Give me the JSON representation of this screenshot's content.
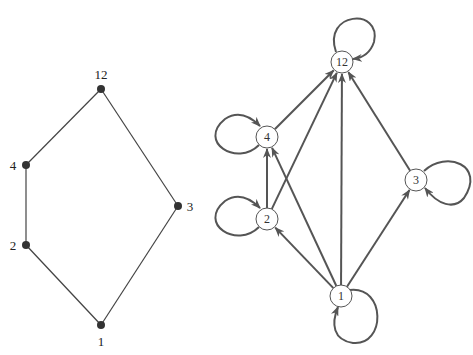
{
  "hasse": {
    "nodes": [
      {
        "id": "1",
        "label": "1",
        "x": 101,
        "y": 325,
        "lx": 101,
        "ly": 346
      },
      {
        "id": "2",
        "label": "2",
        "x": 26,
        "y": 245,
        "lx": 13,
        "ly": 250
      },
      {
        "id": "4",
        "label": "4",
        "x": 26,
        "y": 165,
        "lx": 13,
        "ly": 170
      },
      {
        "id": "3",
        "label": "3",
        "x": 178,
        "y": 206,
        "lx": 190,
        "ly": 211
      },
      {
        "id": "12",
        "label": "12",
        "x": 101,
        "y": 89,
        "lx": 101,
        "ly": 79
      }
    ],
    "edges": [
      [
        "1",
        "2"
      ],
      [
        "2",
        "4"
      ],
      [
        "4",
        "12"
      ],
      [
        "1",
        "3"
      ],
      [
        "3",
        "12"
      ]
    ]
  },
  "digraph": {
    "nodes": [
      {
        "id": "1",
        "label": "1",
        "x": 341,
        "y": 296,
        "loop": "bottom-right"
      },
      {
        "id": "2",
        "label": "2",
        "x": 267,
        "y": 219,
        "loop": "left"
      },
      {
        "id": "4",
        "label": "4",
        "x": 267,
        "y": 137,
        "loop": "left"
      },
      {
        "id": "3",
        "label": "3",
        "x": 416,
        "y": 180,
        "loop": "right"
      },
      {
        "id": "12",
        "label": "12",
        "x": 342,
        "y": 62,
        "loop": "top"
      }
    ],
    "edges": [
      [
        "1",
        "2"
      ],
      [
        "1",
        "3"
      ],
      [
        "1",
        "4"
      ],
      [
        "1",
        "12"
      ],
      [
        "2",
        "4"
      ],
      [
        "2",
        "12"
      ],
      [
        "4",
        "12"
      ],
      [
        "3",
        "12"
      ]
    ],
    "colors": {
      "edge": "#555555",
      "node_stroke": "#555555"
    }
  }
}
